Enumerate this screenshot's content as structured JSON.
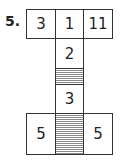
{
  "problem": {
    "number": "5.",
    "top_row": [
      "3",
      "1",
      "11"
    ],
    "column": [
      "2",
      "",
      "3"
    ],
    "bottom_row": [
      "5",
      "",
      "5"
    ],
    "shaded_cells": [
      "column-middle",
      "bottom-middle"
    ]
  }
}
